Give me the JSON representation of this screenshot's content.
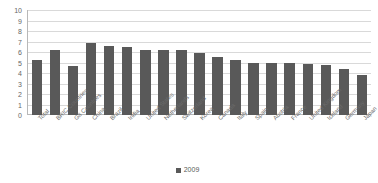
{
  "chart_data": {
    "type": "bar",
    "title": "",
    "subtitle": "",
    "xlabel": "",
    "ylabel": "",
    "ylim": [
      0,
      10
    ],
    "ytick_step": 1,
    "yticks": [
      10,
      9,
      8,
      7,
      6,
      5,
      4,
      3,
      2,
      1,
      0
    ],
    "grid": true,
    "legend_position": "bottom-center",
    "categories": [
      "Total",
      "BRIC Countries",
      "G8 Countries",
      "China",
      "Brazil",
      "India",
      "United States",
      "Netherlands",
      "Switzerland",
      "Korea",
      "Canada",
      "Italy",
      "Spain",
      "Austria",
      "France",
      "United Kingdom",
      "Iceland",
      "Germany",
      "Japan"
    ],
    "series": [
      {
        "name": "2009",
        "color": "#595959",
        "values": [
          5.2,
          6.2,
          4.7,
          6.9,
          6.6,
          6.5,
          6.2,
          6.2,
          6.2,
          5.9,
          5.5,
          5.2,
          5.0,
          5.0,
          5.0,
          4.9,
          4.8,
          4.4,
          3.8
        ]
      }
    ]
  },
  "legend": {
    "items": [
      {
        "label": "2009",
        "color": "#595959"
      }
    ]
  },
  "colors": {
    "bar": "#595959",
    "gridline": "#d9d9d9",
    "axis": "#b8b8b8",
    "text": "#666666",
    "background": "#ffffff"
  }
}
